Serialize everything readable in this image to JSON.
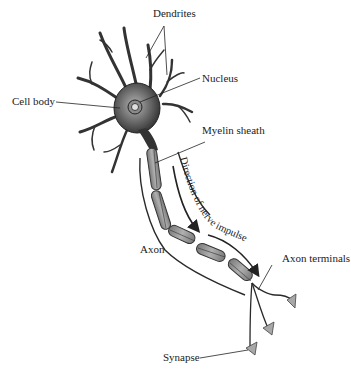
{
  "diagram": {
    "labels": {
      "dendrites": "Dendrites",
      "nucleus": "Nucleus",
      "cell_body": "Cell body",
      "myelin_sheath": "Myelin sheath",
      "direction": "Direction of nerve impulse",
      "axon": "Axon",
      "axon_terminals": "Axon terminals",
      "synapse": "Synapse"
    },
    "colors": {
      "outline": "#2a2a2a",
      "cell_body_fill": "#6e6e6e",
      "myelin_fill": "#9a9a9a",
      "terminal_fill": "#a8a8a8",
      "text": "#222222"
    }
  }
}
